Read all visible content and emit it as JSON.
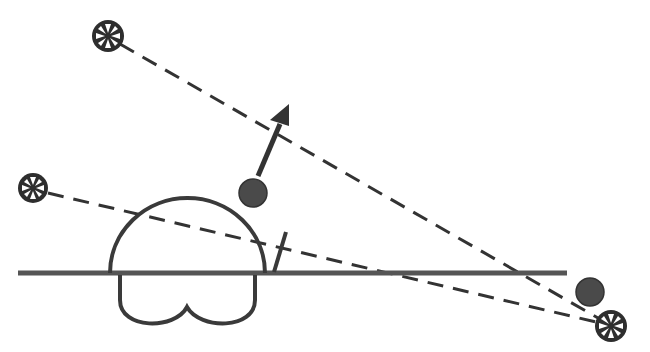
{
  "diagram": {
    "colors": {
      "stroke": "#3a3a3a",
      "ball_fill": "#4a4a4a",
      "background": "#ffffff"
    },
    "sources": [
      {
        "id": "source-top-left",
        "cx": 108,
        "cy": 36,
        "r": 16
      },
      {
        "id": "source-mid-left",
        "cx": 33,
        "cy": 188,
        "r": 15
      },
      {
        "id": "source-bottom-right",
        "cx": 611,
        "cy": 326,
        "r": 16
      }
    ],
    "balls": [
      {
        "id": "ball-center",
        "cx": 253,
        "cy": 193,
        "r": 14
      },
      {
        "id": "ball-right",
        "cx": 590,
        "cy": 292,
        "r": 14
      }
    ],
    "arrow": {
      "x1": 260,
      "y1": 174,
      "x2": 288,
      "y2": 106
    },
    "baseline": {
      "x1": 18,
      "x2": 567,
      "y": 273
    },
    "dashed_lines": [
      {
        "from": "source-top-left",
        "to": "source-bottom-right"
      },
      {
        "from": "source-mid-left",
        "to": "source-bottom-right"
      }
    ]
  }
}
